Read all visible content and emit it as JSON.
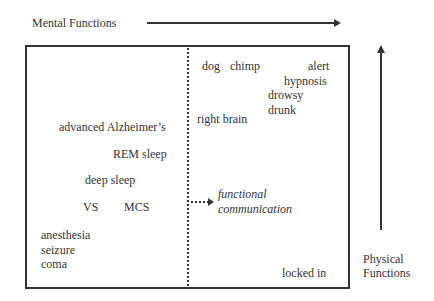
{
  "axes": {
    "x_label": "Mental Functions",
    "y_label_line1": "Physical",
    "y_label_line2": "Functions"
  },
  "quadrant_left": {
    "items": [
      {
        "label": "advanced Alzheimer’s"
      },
      {
        "label": "REM sleep"
      },
      {
        "label": "deep sleep"
      },
      {
        "label": "VS"
      },
      {
        "label": "MCS"
      },
      {
        "label": "anesthesia"
      },
      {
        "label": "seizure"
      },
      {
        "label": "coma"
      }
    ]
  },
  "quadrant_right": {
    "items": [
      {
        "label": "dog"
      },
      {
        "label": "chimp"
      },
      {
        "label": "alert"
      },
      {
        "label": "hypnosis"
      },
      {
        "label": "drowsy"
      },
      {
        "label": "drunk"
      },
      {
        "label": "right brain"
      },
      {
        "label": "locked in"
      }
    ]
  },
  "threshold": {
    "line1": "functional",
    "line2": "communication"
  }
}
